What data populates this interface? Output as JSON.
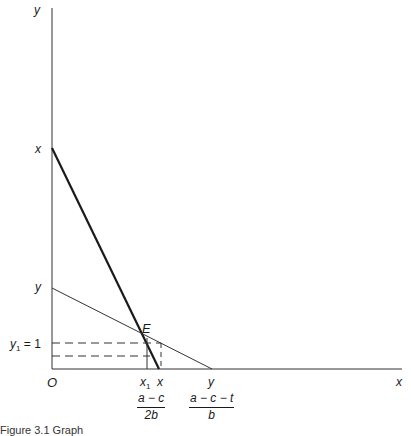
{
  "figure": {
    "caption": "Figure 3.1  Graph",
    "axes": {
      "y_axis_label": "y",
      "x_axis_label": "x",
      "origin_label": "O"
    },
    "y_axis_ticks": {
      "x_intercept_thick": "x",
      "y_intercept_thin": "y",
      "y1_label": "y",
      "y1_subscript": "1",
      "y1_value": " = 1"
    },
    "x_axis_ticks": {
      "x1_label": "x",
      "x1_subscript": "1",
      "x_label": "x",
      "y_label": "y"
    },
    "fractions": {
      "f1_num": "a − c",
      "f1_den": "2b",
      "f2_num": "a − c − t",
      "f2_den": "b"
    },
    "point_label": "E",
    "lines": {
      "thick": {
        "from": [
          52,
          148
        ],
        "to": [
          159,
          369
        ],
        "stroke": "#1a1a1a",
        "width": 2.2
      },
      "thin": {
        "from": [
          52,
          288
        ],
        "to": [
          212,
          369
        ],
        "stroke": "#333333",
        "width": 1
      },
      "intersection_E": [
        146,
        335
      ]
    },
    "colors": {
      "ink": "#1a1a1a",
      "background": "#ffffff"
    }
  }
}
